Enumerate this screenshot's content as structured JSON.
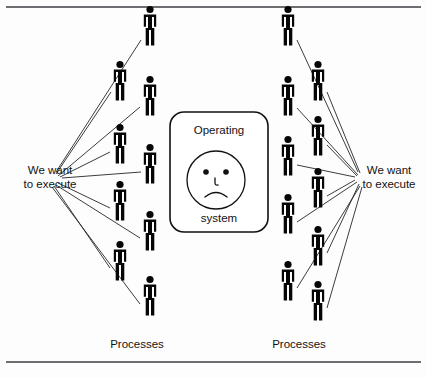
{
  "figure": {
    "type": "diagram",
    "title_text_present": false,
    "background_color": "#fdfdfd",
    "ink_color": "#060606",
    "line_color": "#262628",
    "frame_rule_color": "#6e6e72"
  },
  "center_box": {
    "name": "operating-system-box",
    "top_label": "Operating",
    "bottom_label": "system",
    "face": {
      "expression": "sad",
      "eyes": 2,
      "mouth": "frown"
    }
  },
  "labels": {
    "left_callout_line1": "We want",
    "left_callout_line2": "to execute",
    "right_callout_line1": "We want",
    "right_callout_line2": "to execute",
    "left_caption": "Processes",
    "right_caption": "Processes"
  },
  "people": {
    "icon_name": "person-pictogram",
    "left_group_count": 9,
    "right_group_count": 10,
    "total_count": 19,
    "left_positions": [
      {
        "x": 150,
        "y": 30
      },
      {
        "x": 120,
        "y": 85
      },
      {
        "x": 150,
        "y": 100
      },
      {
        "x": 120,
        "y": 148
      },
      {
        "x": 150,
        "y": 168
      },
      {
        "x": 120,
        "y": 205
      },
      {
        "x": 150,
        "y": 235
      },
      {
        "x": 120,
        "y": 265
      },
      {
        "x": 150,
        "y": 300
      }
    ],
    "right_positions": [
      {
        "x": 288,
        "y": 30
      },
      {
        "x": 318,
        "y": 85
      },
      {
        "x": 288,
        "y": 100
      },
      {
        "x": 318,
        "y": 140
      },
      {
        "x": 288,
        "y": 160
      },
      {
        "x": 318,
        "y": 192
      },
      {
        "x": 288,
        "y": 218
      },
      {
        "x": 318,
        "y": 250
      },
      {
        "x": 288,
        "y": 285
      },
      {
        "x": 318,
        "y": 305
      }
    ]
  },
  "fan_lines": {
    "left_origin": {
      "x": 56,
      "y": 177
    },
    "right_origin": {
      "x": 358,
      "y": 177
    },
    "left_count": 9,
    "right_count": 10
  },
  "frame": {
    "top_rule_y": 7,
    "bottom_rule_y": 362,
    "rule_x_start": 6,
    "rule_x_end": 421
  }
}
